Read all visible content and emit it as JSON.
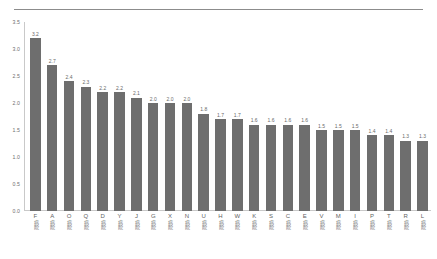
{
  "chart_data": {
    "type": "bar",
    "title": "",
    "xlabel": "",
    "ylabel": "",
    "ylim": [
      0.0,
      3.5
    ],
    "grid": false,
    "legend": null,
    "bar_color": "#6e6e6e",
    "y_ticks": [
      "3.5",
      "3.0",
      "2.5",
      "2.0",
      "1.5",
      "1.0",
      "0.5",
      "0.0"
    ],
    "y_tick_values": [
      3.5,
      3.0,
      2.5,
      2.0,
      1.5,
      1.0,
      0.5,
      0.0
    ],
    "category_suffix": "病院",
    "categories": [
      "F",
      "A",
      "O",
      "Q",
      "D",
      "Y",
      "J",
      "G",
      "X",
      "N",
      "U",
      "H",
      "W",
      "K",
      "S",
      "C",
      "E",
      "V",
      "M",
      "I",
      "P",
      "T",
      "R",
      "L"
    ],
    "category_labels": [
      "F病院",
      "A病院",
      "O病院",
      "Q病院",
      "D病院",
      "Y病院",
      "J病院",
      "G病院",
      "X病院",
      "N病院",
      "U病院",
      "H病院",
      "W病院",
      "K病院",
      "S病院",
      "C病院",
      "E病院",
      "V病院",
      "M病院",
      "I病院",
      "P病院",
      "T病院",
      "R病院",
      "L病院"
    ],
    "values": [
      3.2,
      2.7,
      2.4,
      2.3,
      2.2,
      2.2,
      2.1,
      2.0,
      2.0,
      2.0,
      1.8,
      1.7,
      1.7,
      1.6,
      1.6,
      1.6,
      1.6,
      1.5,
      1.5,
      1.5,
      1.4,
      1.4,
      1.3,
      1.3
    ],
    "value_labels": [
      "3.2",
      "2.7",
      "2.4",
      "2.3",
      "2.2",
      "2.2",
      "2.1",
      "2.0",
      "2.0",
      "2.0",
      "1.8",
      "1.7",
      "1.7",
      "1.6",
      "1.6",
      "1.6",
      "1.6",
      "1.5",
      "1.5",
      "1.5",
      "1.4",
      "1.4",
      "1.3",
      "1.3"
    ]
  }
}
